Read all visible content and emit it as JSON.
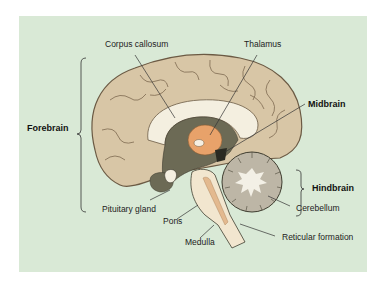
{
  "diagram": {
    "type": "anatomy-sagittal-brain",
    "background_color": "#d9e9d6",
    "labels": {
      "corpus_callosum": "Corpus callosum",
      "thalamus": "Thalamus",
      "midbrain": "Midbrain",
      "forebrain": "Forebrain",
      "hindbrain": "Hindbrain",
      "cerebellum": "Cerebellum",
      "pituitary_gland": "Pituitary gland",
      "pons": "Pons",
      "medulla": "Medulla",
      "reticular_formation": "Reticular formation"
    },
    "colors": {
      "cortex": "#d8c6a6",
      "cortex_stroke": "#6b5a44",
      "corpus_callosum": "#f4efe0",
      "deep_structures": "#6c6a55",
      "thalamus": "#e8a26a",
      "cerebellum": "#bdb6a6",
      "cerebellum_core": "#f3f0e6",
      "brainstem": "#f2e6cf",
      "reticular": "#e3b98f"
    }
  }
}
